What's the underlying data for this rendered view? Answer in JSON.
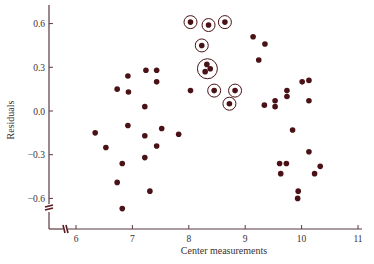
{
  "chart_data": {
    "type": "scatter",
    "title": "",
    "xlabel": "Center measurements",
    "ylabel": "Residuals",
    "xlim": [
      5.5,
      11.1
    ],
    "ylim": [
      -0.77,
      0.72
    ],
    "x_ticks": [
      6,
      7,
      8,
      9,
      10,
      11
    ],
    "x_tick_labels": [
      "6",
      "7",
      "8",
      "9",
      "10",
      "11"
    ],
    "y_ticks": [
      0.6,
      0.3,
      0.0,
      -0.3,
      -0.6
    ],
    "y_tick_labels": [
      "0.6",
      "0.3",
      "0.0",
      "−0.3",
      "−0.6"
    ],
    "grid": false,
    "legend": null,
    "axis_breaks": {
      "x": true,
      "y": true
    },
    "colors": {
      "point": "#4a1216",
      "axis": "#5a3a40",
      "circle": "#4a1216"
    },
    "series": [
      {
        "name": "residuals",
        "points": [
          {
            "x": 6.92,
            "y": 0.24
          },
          {
            "x": 7.24,
            "y": 0.28
          },
          {
            "x": 7.43,
            "y": 0.28
          },
          {
            "x": 7.43,
            "y": 0.2
          },
          {
            "x": 6.73,
            "y": 0.15
          },
          {
            "x": 6.93,
            "y": 0.13
          },
          {
            "x": 7.22,
            "y": 0.03
          },
          {
            "x": 6.92,
            "y": -0.1
          },
          {
            "x": 6.34,
            "y": -0.15
          },
          {
            "x": 7.52,
            "y": -0.12
          },
          {
            "x": 7.22,
            "y": -0.17
          },
          {
            "x": 7.82,
            "y": -0.16
          },
          {
            "x": 6.53,
            "y": -0.25
          },
          {
            "x": 7.43,
            "y": -0.24
          },
          {
            "x": 7.22,
            "y": -0.32
          },
          {
            "x": 6.82,
            "y": -0.36
          },
          {
            "x": 6.73,
            "y": -0.49
          },
          {
            "x": 7.31,
            "y": -0.55
          },
          {
            "x": 6.82,
            "y": -0.67
          },
          {
            "x": 8.03,
            "y": 0.14
          },
          {
            "x": 9.14,
            "y": 0.51
          },
          {
            "x": 9.35,
            "y": 0.46
          },
          {
            "x": 9.24,
            "y": 0.35
          },
          {
            "x": 10.01,
            "y": 0.2
          },
          {
            "x": 10.13,
            "y": 0.21
          },
          {
            "x": 9.74,
            "y": 0.14
          },
          {
            "x": 9.74,
            "y": 0.1
          },
          {
            "x": 9.53,
            "y": 0.07
          },
          {
            "x": 9.53,
            "y": 0.03
          },
          {
            "x": 9.34,
            "y": 0.04
          },
          {
            "x": 10.13,
            "y": 0.07
          },
          {
            "x": 9.84,
            "y": -0.13
          },
          {
            "x": 10.13,
            "y": -0.28
          },
          {
            "x": 9.61,
            "y": -0.36
          },
          {
            "x": 9.73,
            "y": -0.36
          },
          {
            "x": 10.33,
            "y": -0.38
          },
          {
            "x": 9.63,
            "y": -0.43
          },
          {
            "x": 10.23,
            "y": -0.43
          },
          {
            "x": 9.94,
            "y": -0.55
          },
          {
            "x": 9.93,
            "y": -0.6
          }
        ]
      },
      {
        "name": "circled residuals",
        "marker": "circled",
        "points": [
          {
            "x": 8.03,
            "y": 0.61
          },
          {
            "x": 8.35,
            "y": 0.59
          },
          {
            "x": 8.64,
            "y": 0.61
          },
          {
            "x": 8.23,
            "y": 0.45
          },
          {
            "x": 8.45,
            "y": 0.14
          },
          {
            "x": 8.82,
            "y": 0.14
          },
          {
            "x": 8.72,
            "y": 0.05
          }
        ]
      },
      {
        "name": "circled cluster",
        "marker": "large-circle-group",
        "center": {
          "x": 8.33,
          "y": 0.29
        },
        "points": [
          {
            "x": 8.32,
            "y": 0.32
          },
          {
            "x": 8.38,
            "y": 0.29
          },
          {
            "x": 8.29,
            "y": 0.27
          }
        ]
      }
    ]
  }
}
